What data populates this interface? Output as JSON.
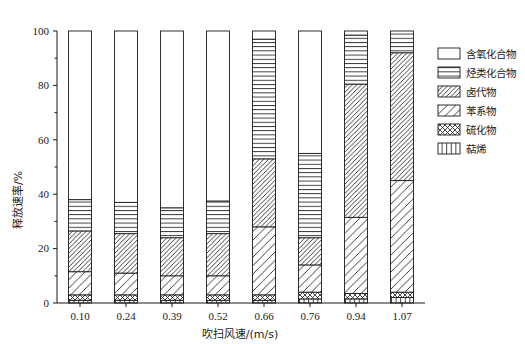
{
  "chart_data": {
    "type": "bar",
    "stacked": true,
    "title": "",
    "xlabel": "吹扫风速/(m/s)",
    "ylabel": "释放速率/%",
    "categories": [
      "0.10",
      "0.24",
      "0.39",
      "0.52",
      "0.66",
      "0.76",
      "0.94",
      "1.07"
    ],
    "ylim": [
      0,
      100
    ],
    "yticks": [
      0,
      20,
      40,
      60,
      80,
      100
    ],
    "ytick_labels": [
      "0",
      "20",
      "40",
      "60",
      "80",
      "100"
    ],
    "grid": false,
    "legend_position": "right",
    "series": [
      {
        "name": "含氧化合物",
        "pattern": "blank",
        "values": [
          62.0,
          63.0,
          65.0,
          62.5,
          3.0,
          45.0,
          1.5,
          0.0
        ]
      },
      {
        "name": "烃类化合物",
        "pattern": "horizontal",
        "values": [
          11.5,
          11.5,
          11.0,
          12.0,
          44.0,
          31.0,
          18.0,
          8.0
        ]
      },
      {
        "name": "卤代物",
        "pattern": "dense-diagonal",
        "values": [
          15.0,
          14.5,
          14.0,
          15.5,
          25.0,
          10.0,
          49.0,
          47.0
        ]
      },
      {
        "name": "苯系物",
        "pattern": "sparse-diagonal",
        "values": [
          8.5,
          8.0,
          7.0,
          7.0,
          25.0,
          10.0,
          28.0,
          41.0
        ]
      },
      {
        "name": "硫化物",
        "pattern": "cross-hatch",
        "values": [
          2.0,
          2.0,
          2.0,
          2.0,
          2.0,
          2.5,
          2.0,
          2.0
        ]
      },
      {
        "name": "萜烯",
        "pattern": "vertical",
        "values": [
          1.0,
          1.0,
          1.0,
          1.0,
          1.0,
          1.5,
          1.5,
          2.0
        ]
      }
    ]
  },
  "legend": {
    "items": [
      {
        "label": "含氧化合物",
        "pattern": "blank"
      },
      {
        "label": "烃类化合物",
        "pattern": "horizontal"
      },
      {
        "label": "卤代物",
        "pattern": "dense-diagonal"
      },
      {
        "label": "苯系物",
        "pattern": "sparse-diagonal"
      },
      {
        "label": "硫化物",
        "pattern": "cross-hatch"
      },
      {
        "label": "萜烯",
        "pattern": "vertical"
      }
    ]
  }
}
